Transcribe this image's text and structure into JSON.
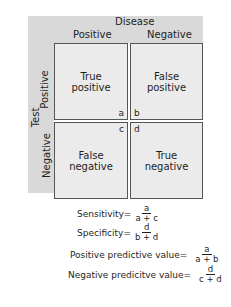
{
  "header": {
    "title": "Disease",
    "col_positive": "Positive",
    "col_negative": "Negative"
  },
  "side": {
    "title": "Test",
    "row_positive": "Positive",
    "row_negative": "Negative"
  },
  "cells": [
    {
      "line1": "True",
      "line2": "positive",
      "corner": "a"
    },
    {
      "line1": "False",
      "line2": "positive",
      "corner": "b"
    },
    {
      "line1": "False",
      "line2": "negative",
      "corner": "c"
    },
    {
      "line1": "True",
      "line2": "negative",
      "corner": "d"
    }
  ],
  "formulas": [
    {
      "label": "Sensitivity=",
      "num": "a",
      "den": "a + c"
    },
    {
      "label": "Specificity=",
      "num": "d",
      "den": "b + d"
    },
    {
      "label": "Positive predictive value=",
      "num": "a",
      "den": "a + b"
    },
    {
      "label": "Negative predicitve value=",
      "num": "d",
      "den": "c + d"
    }
  ],
  "colors": {
    "header_bg": "#d9d9d9",
    "cell_bg": "#ebebeb",
    "border": "#555555"
  }
}
